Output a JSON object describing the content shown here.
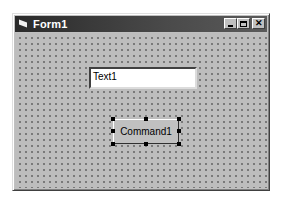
{
  "window": {
    "title": "Form1",
    "controls": {
      "minimize": "minimize",
      "maximize": "maximize",
      "close": "✕"
    }
  },
  "form": {
    "textbox": {
      "value": "Text1"
    },
    "command_button": {
      "label": "Command1",
      "selected": true
    }
  },
  "colors": {
    "titlebar": "#3a3a3a",
    "form_background": "#bdbdbd",
    "textbox_background": "#ffffff"
  }
}
